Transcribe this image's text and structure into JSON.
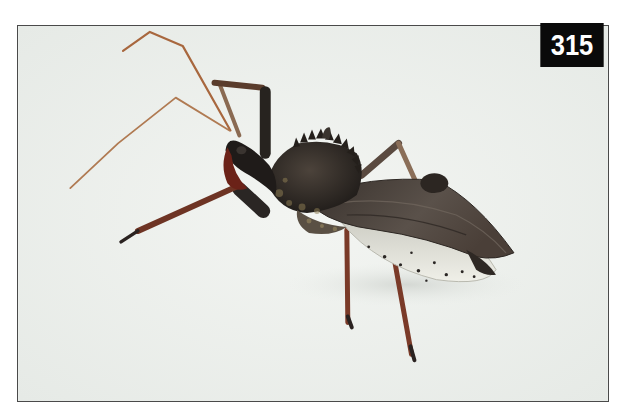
{
  "photo": {
    "subject": "wheel bug (assassin bug) insect on white background",
    "background_color": "#eef1ee",
    "frame_border_color": "#4a4a4a"
  },
  "badge": {
    "number": "315",
    "background_color": "#0a0a0a",
    "text_color": "#ffffff"
  },
  "colors": {
    "body_dark": "#2b2622",
    "body_mid": "#4a423a",
    "wing": "#4e4640",
    "leg_red": "#7a3a28",
    "leg_dark": "#2a2624",
    "antenna": "#a8673e",
    "abdomen_light": "#e4e4dc",
    "beak": "#6b2218"
  }
}
